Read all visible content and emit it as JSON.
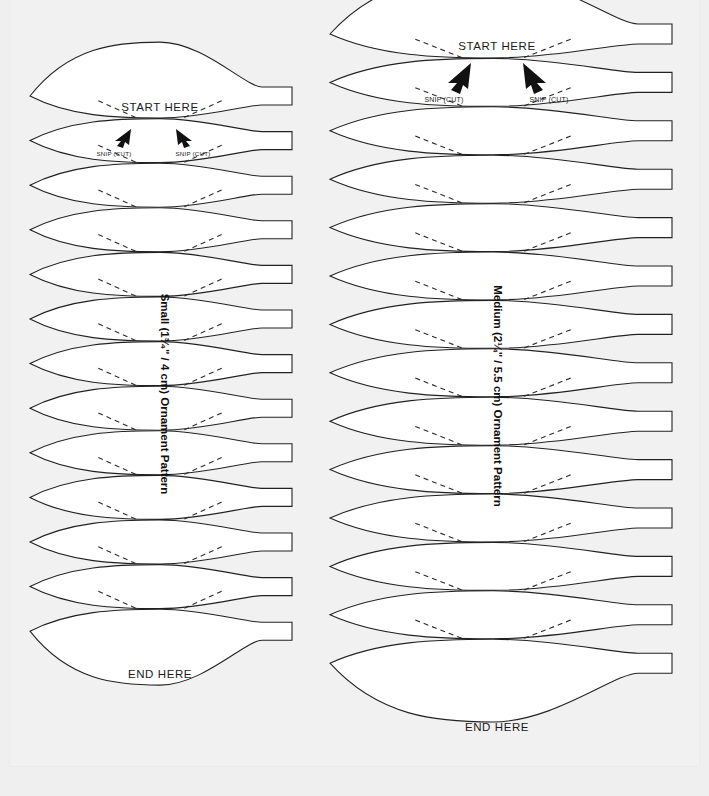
{
  "document": {
    "type": "printable-craft-pattern-sheet",
    "background_color": "#efeff0",
    "sheet_color": "#f1f1f2",
    "ink_color": "#222222"
  },
  "patterns": [
    {
      "id": "small",
      "title": "Small (1³⁄₄\" / 4 cm) Ornament Pattern",
      "title_orientation": "vertical",
      "start_label": "START HERE",
      "end_label": "END HERE",
      "snip_label_left": "SNIP (CUT)",
      "snip_label_right": "SNIP (CUT)",
      "segment_count": 13,
      "geometry": {
        "left_x": 30,
        "center_x": 160,
        "right_tab_x": 262,
        "tab_end_x": 292,
        "top_y": 96,
        "row_height": 44.6,
        "petal_half_height": 22,
        "tab_half_height": 9
      }
    },
    {
      "id": "medium",
      "title": "Medium (2¼\" / 5.5 cm) Ornament Pattern",
      "title_orientation": "vertical",
      "start_label": "START HERE",
      "end_label": "END HERE",
      "snip_label_left": "SNIP (CUT)",
      "snip_label_right": "SNIP (CUT)",
      "segment_count": 14,
      "geometry": {
        "left_x": 330,
        "center_x": 493,
        "right_tab_x": 638,
        "tab_end_x": 672,
        "top_y": 34,
        "row_height": 48.4,
        "petal_half_height": 24,
        "tab_half_height": 10
      }
    }
  ]
}
